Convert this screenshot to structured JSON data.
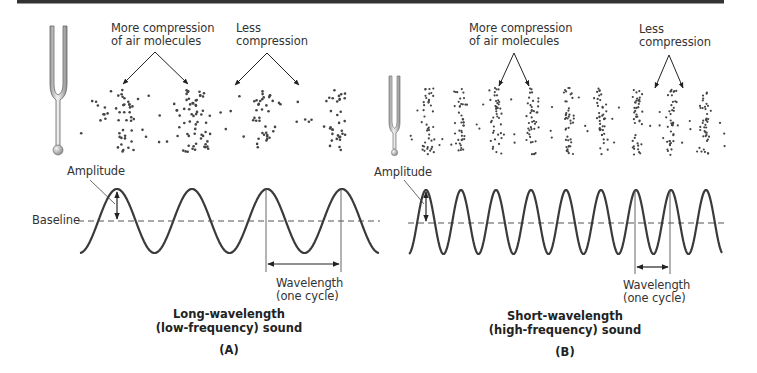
{
  "figure": {
    "top_rule_color": "#333333",
    "wave_color": "#3a3a3a",
    "dot_color": "#444444",
    "baseline_dash_color": "#555555"
  },
  "panels": [
    {
      "id": "A",
      "letter": "(A)",
      "caption_line1": "Long-wavelength",
      "caption_line2": "(low-frequency) sound",
      "compression_label_line1": "More compression",
      "compression_label_line2": "of air molecules",
      "rarefaction_label_line1": "Less",
      "rarefaction_label_line2": "compression",
      "amplitude_label": "Amplitude",
      "baseline_label": "Baseline",
      "wavelength_label_line1": "Wavelength",
      "wavelength_label_line2": "(one cycle)",
      "wave_period_px": 75,
      "peaks_x": [
        117,
        191,
        266,
        341
      ],
      "cluster_centers_x": [
        128,
        196,
        265,
        337
      ]
    },
    {
      "id": "B",
      "letter": "(B)",
      "caption_line1": "Short-wavelength",
      "caption_line2": "(high-frequency) sound",
      "compression_label_line1": "More compression",
      "compression_label_line2": "of air molecules",
      "rarefaction_label_line1": "Less",
      "rarefaction_label_line2": "compression",
      "amplitude_label": "Amplitude",
      "wavelength_label_line1": "Wavelength",
      "wavelength_label_line2": "(one cycle)",
      "wave_period_px": 35,
      "peaks_x": [
        426,
        461,
        496,
        531,
        566,
        601,
        636,
        670,
        705
      ],
      "cluster_centers_x": [
        428,
        461,
        497,
        533,
        568,
        602,
        637,
        671,
        705
      ]
    }
  ]
}
